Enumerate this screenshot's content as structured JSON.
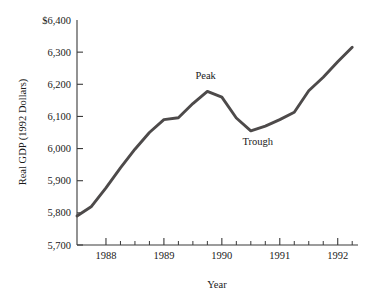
{
  "chart_data": {
    "type": "line",
    "title": "",
    "xlabel": "Year",
    "ylabel": "Real GDP (1992 Dollars)",
    "xlim": [
      1987.5,
      1992.35
    ],
    "ylim": [
      5700,
      6400
    ],
    "grid": false,
    "legend": "none",
    "line_color": "#4d4a4a",
    "axis_color": "#3a3a3a",
    "background_color": "#ffffff",
    "y_ticks": [
      {
        "value": 6400,
        "label": "$6,400"
      },
      {
        "value": 6300,
        "label": "6,300"
      },
      {
        "value": 6200,
        "label": "6,200"
      },
      {
        "value": 6100,
        "label": "6,100"
      },
      {
        "value": 6000,
        "label": "6,000"
      },
      {
        "value": 5900,
        "label": "5,900"
      },
      {
        "value": 5800,
        "label": "5,800"
      },
      {
        "value": 5700,
        "label": "5,700"
      }
    ],
    "x_ticks": [
      {
        "value": 1988.0,
        "label": "1988",
        "major": true
      },
      {
        "value": 1988.25,
        "label": "",
        "major": false
      },
      {
        "value": 1988.5,
        "label": "",
        "major": false
      },
      {
        "value": 1988.75,
        "label": "",
        "major": false
      },
      {
        "value": 1989.0,
        "label": "1989",
        "major": true
      },
      {
        "value": 1989.25,
        "label": "",
        "major": false
      },
      {
        "value": 1989.5,
        "label": "",
        "major": false
      },
      {
        "value": 1989.75,
        "label": "",
        "major": false
      },
      {
        "value": 1990.0,
        "label": "1990",
        "major": true
      },
      {
        "value": 1990.25,
        "label": "",
        "major": false
      },
      {
        "value": 1990.5,
        "label": "",
        "major": false
      },
      {
        "value": 1990.75,
        "label": "",
        "major": false
      },
      {
        "value": 1991.0,
        "label": "1991",
        "major": true
      },
      {
        "value": 1991.25,
        "label": "",
        "major": false
      },
      {
        "value": 1991.5,
        "label": "",
        "major": false
      },
      {
        "value": 1991.75,
        "label": "",
        "major": false
      },
      {
        "value": 1992.0,
        "label": "1992",
        "major": true
      },
      {
        "value": 1992.25,
        "label": "",
        "major": false
      }
    ],
    "x": [
      1987.5,
      1987.75,
      1988.0,
      1988.25,
      1988.5,
      1988.75,
      1989.0,
      1989.25,
      1989.5,
      1989.75,
      1990.0,
      1990.25,
      1990.5,
      1990.75,
      1991.0,
      1991.25,
      1991.5,
      1991.75,
      1992.0,
      1992.25
    ],
    "values": [
      5790,
      5820,
      5878,
      5940,
      5998,
      6050,
      6090,
      6096,
      6140,
      6178,
      6160,
      6095,
      6055,
      6070,
      6090,
      6113,
      6180,
      6222,
      6270,
      6315
    ],
    "series": [
      {
        "name": "Real GDP (1992 Dollars)",
        "values": [
          5790,
          5820,
          5878,
          5940,
          5998,
          6050,
          6090,
          6096,
          6140,
          6178,
          6160,
          6095,
          6055,
          6070,
          6090,
          6113,
          6180,
          6222,
          6270,
          6315
        ]
      }
    ],
    "annotations": [
      {
        "text": "Peak",
        "x": 1989.75,
        "y": 6178,
        "label_x": 1989.72,
        "label_y": 6218
      },
      {
        "text": "Trough",
        "x": 1990.5,
        "y": 6055,
        "label_x": 1990.62,
        "label_y": 6012
      }
    ]
  }
}
